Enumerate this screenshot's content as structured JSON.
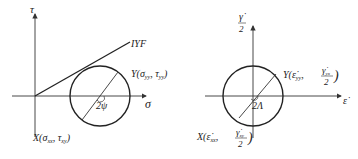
{
  "left_diagram": {
    "title": "Mohr circle of stress",
    "y_axis_label": "τ",
    "x_axis_label": "σ",
    "line_label": "IYF",
    "point_y_label": "Y(σ",
    "point_y_sub1": "yy",
    "point_y_mid": ", τ",
    "point_y_sub2": "yy",
    "point_y_end": ")",
    "point_x_label": "X(σ",
    "point_x_sub1": "xx",
    "point_x_mid": ", τ",
    "point_x_sub2": "xy",
    "point_x_end": ")",
    "angle_label": "2ψ"
  },
  "right_diagram": {
    "title": "Mohr circle of strain rate",
    "y_axis_num": "γ̇",
    "y_axis_den": "2",
    "x_axis_label": "ε̇",
    "point_y_prefix": "Y(",
    "point_y_eps": "ε̇",
    "point_y_sub1": "yy",
    "point_y_gamma": "γ̇",
    "point_y_sub2": "yx",
    "point_y_den": "2",
    "point_x_prefix": "X(",
    "point_x_eps": "ε̇",
    "point_x_sub1": "xx",
    "point_x_gamma": "γ̇",
    "point_x_sub2": "xy",
    "point_x_den": "2",
    "angle_label": "2Λ"
  },
  "colors": {
    "stroke": "#222222",
    "background": "#ffffff"
  }
}
